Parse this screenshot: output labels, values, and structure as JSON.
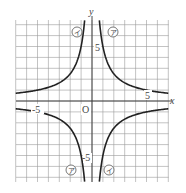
{
  "chart_data": {
    "type": "line",
    "title": "",
    "xlabel": "x",
    "ylabel": "y",
    "origin_label": "O",
    "xlim": [
      -7,
      7
    ],
    "ylim": [
      -7.4,
      7.4
    ],
    "grid": true,
    "tick_labels": {
      "x": [
        "-5",
        "5"
      ],
      "y": [
        "5",
        "-5"
      ]
    },
    "series": [
      {
        "name": "ア",
        "label_glyph": "ア",
        "equation": "y = 5/x",
        "quadrants": [
          "I",
          "III"
        ]
      },
      {
        "name": "イ",
        "label_glyph": "イ",
        "equation": "y = -5/x",
        "quadrants": [
          "II",
          "IV"
        ]
      }
    ]
  },
  "labels": {
    "x_axis": "x",
    "y_axis": "y",
    "origin": "O",
    "x_neg5": "-5",
    "x_pos5": "5",
    "y_pos5": "5",
    "y_neg5": "-5",
    "curve_a": "ア",
    "curve_i": "イ"
  }
}
